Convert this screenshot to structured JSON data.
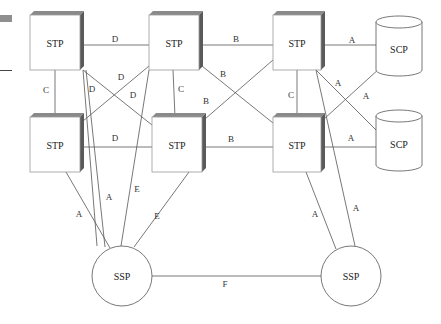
{
  "diagram": {
    "type": "SS7 signaling network",
    "nodes": [
      {
        "id": "stp_tl",
        "kind": "STP",
        "label": "STP",
        "x": 30,
        "y": 15,
        "w": 50,
        "h": 55
      },
      {
        "id": "stp_tm",
        "kind": "STP",
        "label": "STP",
        "x": 149,
        "y": 15,
        "w": 50,
        "h": 55
      },
      {
        "id": "stp_tr",
        "kind": "STP",
        "label": "STP",
        "x": 273,
        "y": 15,
        "w": 48,
        "h": 55
      },
      {
        "id": "stp_bl",
        "kind": "STP",
        "label": "STP",
        "x": 30,
        "y": 117,
        "w": 50,
        "h": 55
      },
      {
        "id": "stp_bm",
        "kind": "STP",
        "label": "STP",
        "x": 152,
        "y": 117,
        "w": 50,
        "h": 55
      },
      {
        "id": "stp_br",
        "kind": "STP",
        "label": "STP",
        "x": 273,
        "y": 117,
        "w": 48,
        "h": 55
      },
      {
        "id": "scp_t",
        "kind": "SCP",
        "label": "SCP",
        "cx": 399,
        "top": 22,
        "bottom": 70,
        "rx": 23
      },
      {
        "id": "scp_b",
        "kind": "SCP",
        "label": "SCP",
        "cx": 399,
        "top": 116,
        "bottom": 165,
        "rx": 23
      },
      {
        "id": "ssp_l",
        "kind": "SSP",
        "label": "SSP",
        "cx": 122,
        "cy": 276,
        "r": 30
      },
      {
        "id": "ssp_r",
        "kind": "SSP",
        "label": "SSP",
        "cx": 351,
        "cy": 276,
        "r": 30
      }
    ],
    "links": [
      {
        "from": [
          83,
          45
        ],
        "to": [
          149,
          45
        ],
        "label": "D",
        "lx": 115,
        "ly": 39
      },
      {
        "from": [
          202,
          45
        ],
        "to": [
          273,
          45
        ],
        "label": "B",
        "lx": 236,
        "ly": 39
      },
      {
        "from": [
          324,
          45
        ],
        "to": [
          376,
          45
        ],
        "label": "A",
        "lx": 352,
        "ly": 40
      },
      {
        "from": [
          55,
          70
        ],
        "to": [
          55,
          117
        ],
        "label": "C",
        "lx": 46,
        "ly": 90
      },
      {
        "from": [
          173,
          70
        ],
        "to": [
          175,
          117
        ],
        "label": "C",
        "lx": 181,
        "ly": 89
      },
      {
        "from": [
          297,
          70
        ],
        "to": [
          297,
          117
        ],
        "label": "C",
        "lx": 291,
        "ly": 95
      },
      {
        "from": [
          83,
          147
        ],
        "to": [
          152,
          147
        ],
        "label": "D",
        "lx": 115,
        "ly": 138
      },
      {
        "from": [
          205,
          147
        ],
        "to": [
          273,
          147
        ],
        "label": "B",
        "lx": 231,
        "ly": 139
      },
      {
        "from": [
          324,
          147
        ],
        "to": [
          376,
          147
        ],
        "label": "A",
        "lx": 351,
        "ly": 138
      },
      {
        "from": [
          83,
          70
        ],
        "to": [
          152,
          125
        ],
        "label": "D",
        "lx": 133,
        "ly": 95
      },
      {
        "from": [
          149,
          66
        ],
        "to": [
          83,
          121
        ],
        "label": "D",
        "lx": 121,
        "ly": 77
      },
      {
        "from": [
          83,
          70
        ],
        "to": [
          97,
          246
        ],
        "label": "D",
        "lx": 92,
        "ly": 89
      },
      {
        "from": [
          202,
          66
        ],
        "to": [
          273,
          123
        ],
        "label": "B",
        "lx": 223,
        "ly": 74
      },
      {
        "from": [
          273,
          60
        ],
        "to": [
          205,
          119
        ],
        "label": "B",
        "lx": 206,
        "ly": 101
      },
      {
        "from": [
          149,
          70
        ],
        "to": [
          121,
          246
        ],
        "label": "E",
        "lx": 137,
        "ly": 189
      },
      {
        "from": [
          316,
          70
        ],
        "to": [
          376,
          130
        ],
        "label": "A",
        "lx": 338,
        "ly": 83
      },
      {
        "from": [
          380,
          68
        ],
        "to": [
          324,
          119
        ],
        "label": "A",
        "lx": 366,
        "ly": 96
      },
      {
        "from": [
          316,
          70
        ],
        "to": [
          355,
          246
        ],
        "label": "A",
        "lx": 356,
        "ly": 208
      },
      {
        "from": [
          66,
          172
        ],
        "to": [
          110,
          248
        ],
        "label": "A",
        "lx": 79,
        "ly": 214
      },
      {
        "from": [
          189,
          172
        ],
        "to": [
          134,
          247
        ],
        "label": "E",
        "lx": 157,
        "ly": 216
      },
      {
        "from": [
          86,
          70
        ],
        "to": [
          105,
          247
        ],
        "label": "A",
        "lx": 109,
        "ly": 197
      },
      {
        "from": [
          306,
          172
        ],
        "to": [
          336,
          249
        ],
        "label": "A",
        "lx": 315,
        "ly": 214
      },
      {
        "from": [
          152,
          276
        ],
        "to": [
          321,
          276
        ],
        "label": "F",
        "lx": 225,
        "ly": 284
      }
    ],
    "colors": {
      "line": "#555555",
      "box_border": "#9a9a9a",
      "box_top": "#8a8a8a",
      "box_side": "#5a5a5a",
      "text": "#222222"
    }
  }
}
